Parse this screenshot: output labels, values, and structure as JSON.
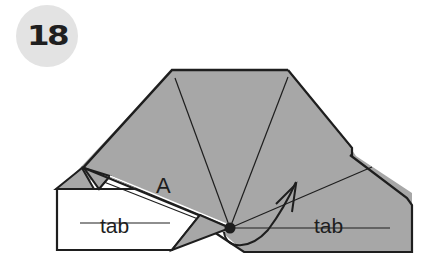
{
  "step": {
    "number": "18"
  },
  "diagram": {
    "labels": {
      "flap": "A",
      "left_tab": "tab",
      "right_tab": "tab"
    },
    "colors": {
      "paper_fill": "#a7a7a7",
      "white_face": "#ffffff",
      "line": "#1e1e1e",
      "badge": "#e3e3e3"
    }
  }
}
